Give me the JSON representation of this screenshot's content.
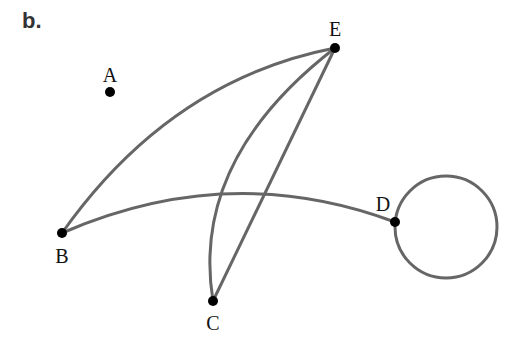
{
  "panel_label": "b.",
  "graph": {
    "nodes": [
      {
        "id": "A",
        "label": "A",
        "x": 110,
        "y": 92,
        "lx": 110,
        "ly": 82
      },
      {
        "id": "E",
        "label": "E",
        "x": 335,
        "y": 48,
        "lx": 335,
        "ly": 36
      },
      {
        "id": "B",
        "label": "B",
        "x": 62,
        "y": 233,
        "lx": 62,
        "ly": 263
      },
      {
        "id": "D",
        "label": "D",
        "x": 395,
        "y": 222,
        "lx": 383,
        "ly": 211
      },
      {
        "id": "C",
        "label": "C",
        "x": 213,
        "y": 301,
        "lx": 213,
        "ly": 330
      }
    ],
    "edges": [
      {
        "from": "B",
        "to": "E",
        "type": "curve"
      },
      {
        "from": "B",
        "to": "D",
        "type": "curve"
      },
      {
        "from": "C",
        "to": "E",
        "type": "curve"
      },
      {
        "from": "C",
        "to": "E",
        "type": "straight"
      },
      {
        "from": "D",
        "to": "D",
        "type": "loop"
      }
    ],
    "edge_color": "#666666",
    "node_color": "#000000"
  }
}
